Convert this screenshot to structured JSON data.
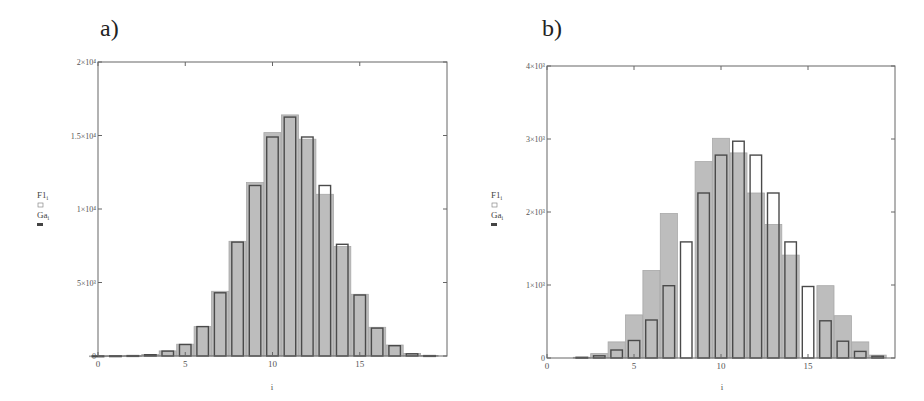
{
  "chart_data": [
    {
      "type": "bar",
      "panel_label": "a)",
      "title": "",
      "xlabel": "i",
      "ylabel_lines": [
        "F1",
        "Ga"
      ],
      "ylabel_subscript": "i",
      "xlim": [
        0,
        20
      ],
      "ylim": [
        0,
        20000
      ],
      "x_ticks": [
        0,
        5,
        10,
        15
      ],
      "x_tick_labels": [
        "0",
        "5",
        "10",
        "15"
      ],
      "y_ticks": [
        0,
        5000,
        10000,
        15000,
        20000
      ],
      "y_tick_labels": [
        "0",
        "5×10³",
        "1×10⁴",
        "1.5×10⁴",
        "2×10⁴"
      ],
      "grid": false,
      "categories": [
        0,
        1,
        2,
        3,
        4,
        5,
        6,
        7,
        8,
        9,
        10,
        11,
        12,
        13,
        14,
        15,
        16,
        17,
        18,
        19
      ],
      "series": [
        {
          "name": "Ga_i",
          "style": "filled-gray",
          "values": [
            10,
            15,
            30,
            100,
            350,
            800,
            2000,
            4400,
            7800,
            11800,
            15200,
            16400,
            14750,
            11000,
            7450,
            4200,
            1950,
            750,
            180,
            40
          ]
        },
        {
          "name": "F1_i",
          "style": "outline",
          "values": [
            10,
            15,
            30,
            90,
            330,
            780,
            2000,
            4300,
            7750,
            11600,
            14900,
            16250,
            14900,
            11600,
            7600,
            4150,
            1900,
            700,
            150,
            30
          ]
        }
      ]
    },
    {
      "type": "bar",
      "panel_label": "b)",
      "title": "",
      "xlabel": "i",
      "ylabel_lines": [
        "F1",
        "Ga"
      ],
      "ylabel_subscript": "i",
      "xlim": [
        0,
        20
      ],
      "ylim": [
        0,
        4000
      ],
      "x_ticks": [
        0,
        5,
        10,
        15
      ],
      "x_tick_labels": [
        "0",
        "5",
        "10",
        "15"
      ],
      "y_ticks": [
        0,
        1000,
        2000,
        3000,
        4000
      ],
      "y_tick_labels": [
        "0",
        "1×10³",
        "2×10³",
        "3×10³",
        "4×10³"
      ],
      "grid": false,
      "categories": [
        0,
        1,
        2,
        3,
        4,
        5,
        6,
        7,
        8,
        9,
        10,
        11,
        12,
        13,
        14,
        15,
        16,
        17,
        18,
        19
      ],
      "series": [
        {
          "name": "Ga_i",
          "style": "filled-gray",
          "values": [
            0,
            0,
            10,
            60,
            220,
            590,
            1200,
            1980,
            0,
            2690,
            3010,
            2810,
            2260,
            1830,
            1410,
            0,
            990,
            580,
            220,
            40
          ]
        },
        {
          "name": "F1_i",
          "style": "outline",
          "values": [
            0,
            0,
            10,
            30,
            110,
            240,
            520,
            990,
            1590,
            2260,
            2780,
            2970,
            2780,
            2260,
            1590,
            980,
            510,
            230,
            90,
            25
          ]
        }
      ]
    }
  ]
}
